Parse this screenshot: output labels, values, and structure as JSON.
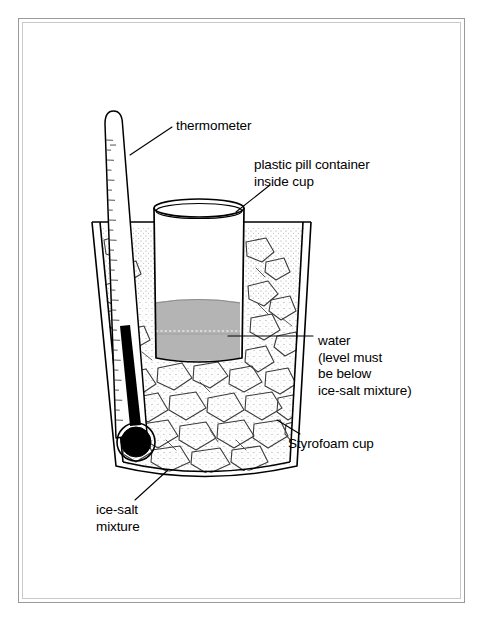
{
  "figure": {
    "type": "line-art-diagram",
    "background_color": "#ffffff",
    "line_color": "#000000",
    "frame": {
      "outer_color": "#9a9a9a",
      "inner_color": "#c9c9c9"
    }
  },
  "labels": {
    "thermometer": "thermometer",
    "pill_container_line1": "plastic pill container",
    "pill_container_line2": "inside cup",
    "water_line1": "water",
    "water_line2": "(level must",
    "water_line3": "be below",
    "water_line4": "ice-salt mixture)",
    "styrofoam_cup": "Styrofoam cup",
    "ice_salt_line1": "ice-salt",
    "ice_salt_line2": "mixture"
  },
  "components": {
    "thermometer": {
      "name": "thermometer",
      "tube_fill": "#ffffff",
      "mercury_color": "#000000",
      "has_scale_ticks": true,
      "tilt_degrees": 9
    },
    "pill_container": {
      "name": "plastic pill container",
      "body_fill": "#ffffff",
      "outline": "#000000"
    },
    "water": {
      "name": "water",
      "fill": "#b4b4b4",
      "surface_line": "#7a7a7a",
      "dashed_marker_line": true
    },
    "styrofoam_cup": {
      "name": "Styrofoam cup",
      "fill": "#ffffff",
      "wall_style": "double-line"
    },
    "ice_salt_mixture": {
      "name": "ice-salt mixture",
      "chunk_fill": "#ffffff",
      "stipple_color": "#8a8a8a",
      "outline": "#3a3a3a"
    }
  },
  "leader_lines": [
    {
      "name": "thermometer-leader",
      "from": "thermometer tube",
      "to": "thermometer label"
    },
    {
      "name": "pill-leader",
      "from": "pill container rim",
      "to": "plastic pill container label"
    },
    {
      "name": "water-leader",
      "from": "water body",
      "to": "water label"
    },
    {
      "name": "styrofoam-leader",
      "from": "cup wall",
      "to": "Styrofoam cup label"
    },
    {
      "name": "ice-salt-leader",
      "from": "ice chunks",
      "to": "ice-salt mixture label"
    }
  ]
}
